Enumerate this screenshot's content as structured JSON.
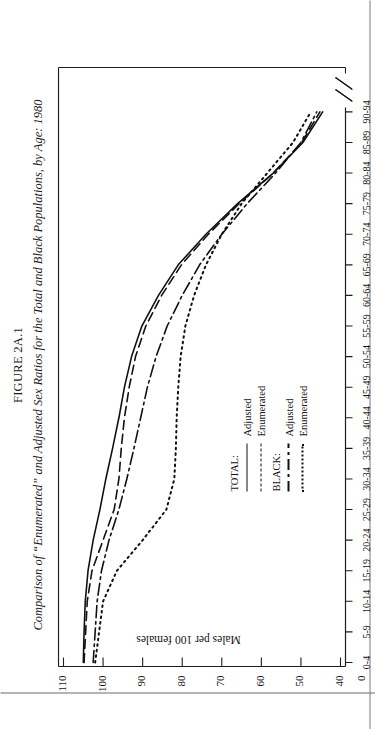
{
  "figure": {
    "number": "FIGURE 2A.1",
    "caption": "Comparison of “Enumerated” and Adjusted Sex Ratios for the Total and Black Populations, by Age: 1980"
  },
  "chart_data": {
    "type": "line",
    "title": "Comparison of “Enumerated” and Adjusted Sex Ratios for the Total and Black Populations, by Age: 1980",
    "xlabel": "AGE",
    "ylabel": "Males per 100 females",
    "grid": false,
    "legend_position": "center-left",
    "axis_break_y": true,
    "axis_break_x": true,
    "ylim": [
      40,
      110
    ],
    "yticks": [
      "0",
      "40",
      "50",
      "60",
      "70",
      "80",
      "90",
      "100",
      "110"
    ],
    "categories": [
      "0-4",
      "5-9",
      "10-14",
      "15-19",
      "20-24",
      "25-29",
      "30-34",
      "35-39",
      "40-44",
      "45-49",
      "50-54",
      "55-59",
      "60-64",
      "65-69",
      "70-74",
      "75-79",
      "80-84",
      "85-89",
      "90-94"
    ],
    "series": [
      {
        "name": "TOTAL: Adjusted",
        "group": "TOTAL:",
        "label": "Adjusted",
        "style": "solid",
        "values": [
          105.0,
          104.8,
          104.5,
          103.8,
          102.5,
          100.8,
          99.3,
          97.6,
          96.0,
          94.6,
          92.8,
          90.2,
          86.0,
          81.0,
          74.0,
          66.0,
          57.0,
          49.5,
          44.5
        ]
      },
      {
        "name": "TOTAL: Enumerated",
        "group": "TOTAL:",
        "label": "Enumerated",
        "style": "dashed",
        "values": [
          104.8,
          104.4,
          104.0,
          102.8,
          100.0,
          97.2,
          96.0,
          95.4,
          94.6,
          93.4,
          91.8,
          89.2,
          85.2,
          80.2,
          73.4,
          65.6,
          57.0,
          49.8,
          45.2
        ]
      },
      {
        "name": "BLACK: Adjusted",
        "group": "BLACK:",
        "label": "Adjusted",
        "style": "dashdot",
        "values": [
          102.5,
          102.0,
          101.5,
          100.4,
          98.5,
          96.0,
          94.0,
          92.2,
          90.5,
          88.8,
          86.6,
          83.8,
          80.0,
          75.6,
          70.0,
          63.6,
          56.4,
          50.0,
          46.0
        ]
      },
      {
        "name": "BLACK: Enumerated",
        "group": "BLACK:",
        "label": "Enumerated",
        "style": "dotted",
        "values": [
          102.0,
          101.0,
          100.0,
          96.5,
          90.0,
          84.0,
          82.0,
          81.6,
          81.4,
          81.0,
          80.4,
          79.2,
          77.0,
          74.0,
          70.0,
          65.0,
          58.5,
          52.0,
          47.5
        ]
      }
    ]
  },
  "legend": {
    "groups": [
      {
        "title": "TOTAL:",
        "items": [
          {
            "label": "Adjusted",
            "style": "solid"
          },
          {
            "label": "Enumerated",
            "style": "dashed"
          }
        ]
      },
      {
        "title": "BLACK:",
        "items": [
          {
            "label": "Adjusted",
            "style": "dashdot"
          },
          {
            "label": "Enumerated",
            "style": "dotted"
          }
        ]
      }
    ]
  },
  "colors": {
    "ink": "#141414",
    "page": "#ffffff",
    "edge": "#6b6b6b"
  }
}
